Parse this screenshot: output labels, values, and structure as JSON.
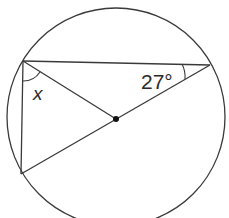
{
  "diagram": {
    "colors": {
      "stroke": "#3a3a3a",
      "background": "#ffffff"
    },
    "circle": {
      "cx": 116,
      "cy": 117,
      "r": 109
    },
    "center": {
      "x": 116,
      "y": 119
    },
    "points": {
      "A": {
        "x": 23,
        "y": 61
      },
      "B": {
        "x": 210,
        "y": 65
      },
      "C": {
        "x": 21,
        "y": 174
      }
    },
    "labels": {
      "angle_x": "x",
      "angle_27": "27°"
    }
  }
}
